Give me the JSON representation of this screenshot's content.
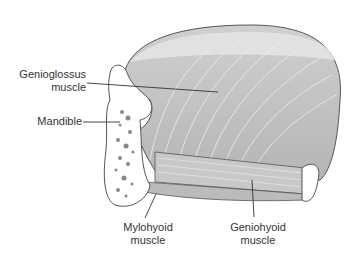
{
  "labels": {
    "genioglossus": [
      "Genioglossus",
      "muscle"
    ],
    "mandible": "Mandible",
    "mylohyoid": [
      "Mylohyoid",
      "muscle"
    ],
    "geniohyoid": [
      "Geniohyoid",
      "muscle"
    ]
  },
  "colors": {
    "muscle": "#bdbdbd",
    "muscle_light": "#d6d6d6",
    "outline": "#555555",
    "bone": "#ffffff",
    "marrow": "#888888",
    "text": "#333333"
  }
}
